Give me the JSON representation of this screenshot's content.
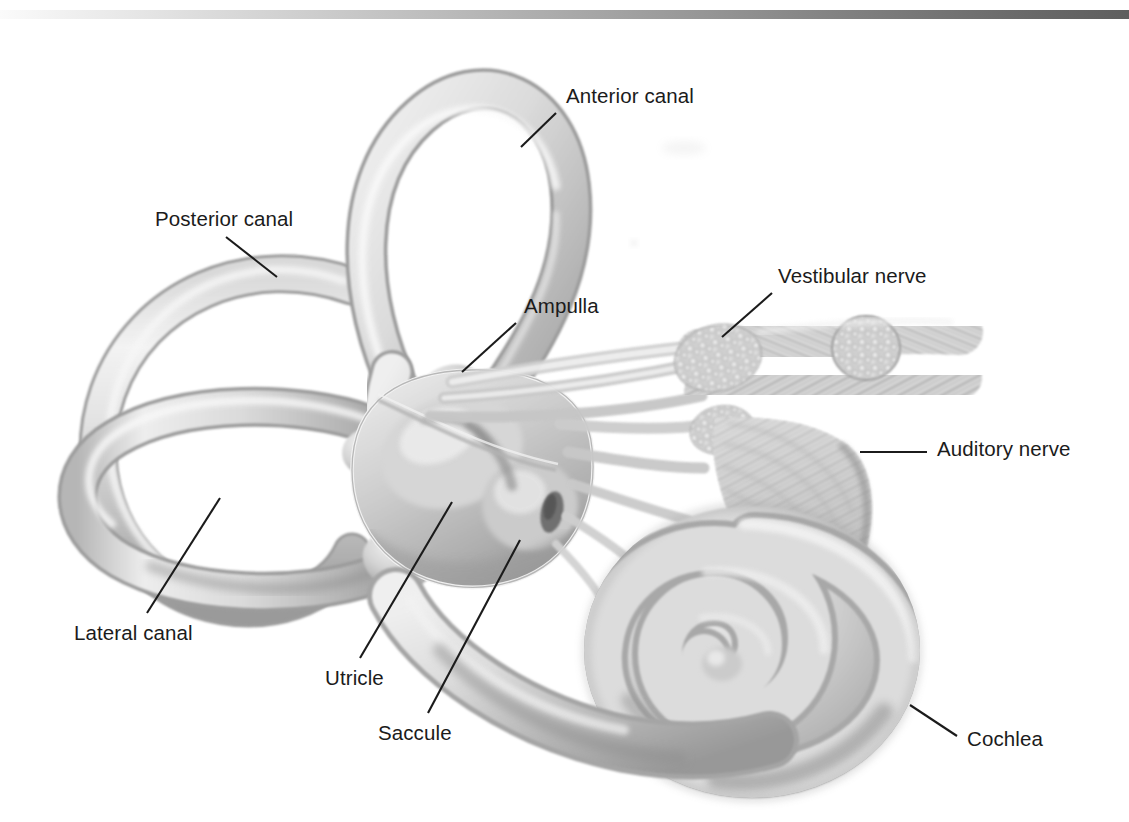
{
  "figure": {
    "style": "grayscale pencil / airbrush medical illustration on white background",
    "background_color": "#ffffff",
    "ink_color": "#1b1b1b",
    "top_rule": {
      "name": "header-rule",
      "gradient_from": "#fbfbfb",
      "gradient_to": "#5e5e5e",
      "y": 10,
      "height": 9
    }
  },
  "labels": [
    {
      "id": "anterior-canal",
      "text": "Anterior canal",
      "x": 566,
      "y": 86,
      "leader": {
        "x1": 556,
        "y1": 113,
        "x2": 521,
        "y2": 147
      }
    },
    {
      "id": "posterior-canal",
      "text": "Posterior canal",
      "x": 155,
      "y": 209,
      "leader": {
        "x1": 226,
        "y1": 237,
        "x2": 277,
        "y2": 277
      }
    },
    {
      "id": "ampulla",
      "text": "Ampulla",
      "x": 524,
      "y": 296,
      "leader": {
        "x1": 516,
        "y1": 323,
        "x2": 462,
        "y2": 372
      }
    },
    {
      "id": "vestibular-nerve",
      "text": "Vestibular nerve",
      "x": 778,
      "y": 266,
      "leader": {
        "x1": 772,
        "y1": 293,
        "x2": 722,
        "y2": 337
      }
    },
    {
      "id": "auditory-nerve",
      "text": "Auditory nerve",
      "x": 937,
      "y": 439,
      "leader": {
        "x1": 860,
        "y1": 452,
        "x2": 927,
        "y2": 452
      }
    },
    {
      "id": "lateral-canal",
      "text": "Lateral canal",
      "x": 74,
      "y": 623,
      "leader": {
        "x1": 147,
        "y1": 613,
        "x2": 220,
        "y2": 498
      }
    },
    {
      "id": "utricle",
      "text": "Utricle",
      "x": 325,
      "y": 668,
      "leader": {
        "x1": 360,
        "y1": 658,
        "x2": 452,
        "y2": 502
      }
    },
    {
      "id": "saccule",
      "text": "Saccule",
      "x": 378,
      "y": 723,
      "leader": {
        "x1": 428,
        "y1": 713,
        "x2": 520,
        "y2": 540
      }
    },
    {
      "id": "cochlea",
      "text": "Cochlea",
      "x": 967,
      "y": 729,
      "leader": {
        "x1": 957,
        "y1": 736,
        "x2": 910,
        "y2": 705
      }
    }
  ],
  "structures": [
    {
      "id": "anterior-semicircular-canal",
      "name": "Anterior canal"
    },
    {
      "id": "posterior-semicircular-canal",
      "name": "Posterior canal"
    },
    {
      "id": "lateral-semicircular-canal",
      "name": "Lateral canal"
    },
    {
      "id": "ampulla",
      "name": "Ampulla"
    },
    {
      "id": "vestibule",
      "name": "Vestibule"
    },
    {
      "id": "utricle",
      "name": "Utricle"
    },
    {
      "id": "saccule",
      "name": "Saccule"
    },
    {
      "id": "vestibular-nerve",
      "name": "Vestibular nerve"
    },
    {
      "id": "auditory-nerve",
      "name": "Auditory nerve"
    },
    {
      "id": "cochlea",
      "name": "Cochlea"
    }
  ]
}
